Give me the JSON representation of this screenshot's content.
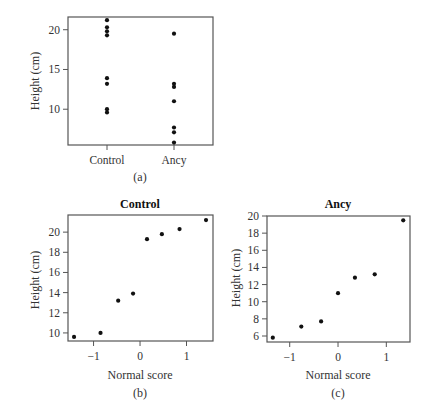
{
  "figure": {
    "panels": [
      {
        "id": "a",
        "caption": "(a)"
      },
      {
        "id": "b",
        "caption": "(b)",
        "title": "Control"
      },
      {
        "id": "c",
        "caption": "(c)",
        "title": "Ancy"
      }
    ]
  },
  "chart_data": [
    {
      "id": "a",
      "type": "scatter",
      "subtype": "strip",
      "title": "",
      "caption": "(a)",
      "xlabel": "",
      "ylabel": "Height (cm)",
      "categories": [
        "Control",
        "Ancy"
      ],
      "yticks": [
        10,
        15,
        20
      ],
      "ylim": [
        5.5,
        21.6
      ],
      "series": [
        {
          "name": "Control",
          "values": [
            9.6,
            10.0,
            13.2,
            13.9,
            19.3,
            19.8,
            20.3,
            21.2
          ]
        },
        {
          "name": "Ancy",
          "values": [
            5.8,
            7.1,
            7.7,
            11.0,
            12.8,
            13.2,
            19.5
          ]
        }
      ],
      "grid": false,
      "legend": "none"
    },
    {
      "id": "b",
      "type": "scatter",
      "title": "Control",
      "caption": "(b)",
      "xlabel": "Normal score",
      "ylabel": "Height (cm)",
      "xticks": [
        -1,
        0,
        1
      ],
      "yticks": [
        10,
        12,
        14,
        16,
        18,
        20
      ],
      "xlim": [
        -1.55,
        1.57
      ],
      "ylim": [
        9.2,
        21.7
      ],
      "x": [
        -1.42,
        -0.85,
        -0.47,
        -0.15,
        0.15,
        0.47,
        0.85,
        1.42
      ],
      "y": [
        9.6,
        10.0,
        13.2,
        13.9,
        19.3,
        19.8,
        20.3,
        21.2
      ],
      "grid": false,
      "legend": "none"
    },
    {
      "id": "c",
      "type": "scatter",
      "title": "Ancy",
      "caption": "(c)",
      "xlabel": "Normal score",
      "ylabel": "Height (cm)",
      "xticks": [
        -1,
        0,
        1
      ],
      "yticks": [
        6,
        8,
        10,
        12,
        14,
        16,
        18,
        20
      ],
      "xlim": [
        -1.47,
        1.49
      ],
      "ylim": [
        5.3,
        20.0
      ],
      "x": [
        -1.35,
        -0.76,
        -0.35,
        0.0,
        0.35,
        0.76,
        1.35
      ],
      "y": [
        5.8,
        7.1,
        7.7,
        11.0,
        12.8,
        13.2,
        19.5
      ],
      "grid": false,
      "legend": "none"
    }
  ]
}
